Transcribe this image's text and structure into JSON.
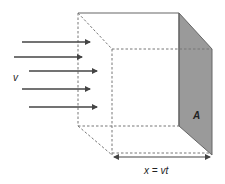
{
  "diagram": {
    "labels": {
      "velocity": "v",
      "area": "A",
      "distance": "x = vt"
    },
    "colors": {
      "line": "#555555",
      "dashed": "#777777",
      "shaded_face": "#9a9a9a",
      "arrow": "#444444",
      "text": "#222222"
    },
    "arrows": [
      {
        "x1": 22,
        "x2": 90,
        "y": 42
      },
      {
        "x1": 14,
        "x2": 82,
        "y": 57
      },
      {
        "x1": 29,
        "x2": 97,
        "y": 71
      },
      {
        "x1": 22,
        "x2": 90,
        "y": 89
      },
      {
        "x1": 29,
        "x2": 97,
        "y": 107
      }
    ]
  }
}
